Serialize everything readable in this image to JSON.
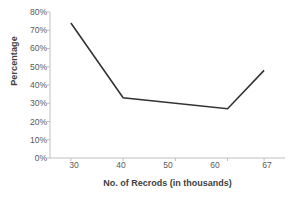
{
  "chart_data": {
    "type": "line",
    "title": "",
    "subtitle": "",
    "xlabel": "No. of Recrods  (in thousands)",
    "ylabel": "Percentage",
    "x": [
      30,
      40,
      50,
      60,
      67
    ],
    "values": [
      74,
      33,
      30,
      27,
      48
    ],
    "series": [
      {
        "name": "Percentage",
        "x": [
          30,
          40,
          60,
          67
        ],
        "values": [
          74,
          33,
          27,
          48
        ],
        "color": "#333333"
      }
    ],
    "xtick_labels": [
      "30",
      "40",
      "50",
      "60",
      "67"
    ],
    "xtick_values": [
      30,
      40,
      50,
      60,
      67
    ],
    "ytick_labels": [
      "0%",
      "10%",
      "20%",
      "30%",
      "40%",
      "50%",
      "60%",
      "70%",
      "80%"
    ],
    "ytick_values": [
      0,
      10,
      20,
      30,
      40,
      50,
      60,
      70,
      80
    ],
    "ylim": [
      0,
      80
    ],
    "xlim": [
      26,
      71
    ],
    "grid": false,
    "legend": false,
    "legend_position": "none",
    "line_color": "#333333",
    "axis_color": "#bfbfbf",
    "background_color": "#ffffff",
    "text_color": "#595959"
  }
}
